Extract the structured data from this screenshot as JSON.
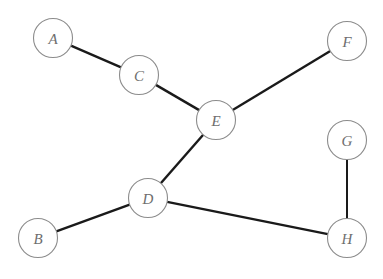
{
  "diagram": {
    "type": "node-link-graph",
    "background_color": "#ffffff",
    "node_fill": "#ffffff",
    "node_stroke": "#8c8c8c",
    "edge_color": "#1a1a1a",
    "label_color": "#6e6e6e",
    "node_radius": 19.5,
    "nodes": [
      {
        "id": "A",
        "label": "A",
        "cx": 53,
        "cy": 38
      },
      {
        "id": "B",
        "label": "B",
        "cx": 38,
        "cy": 238
      },
      {
        "id": "C",
        "label": "C",
        "cx": 139,
        "cy": 75
      },
      {
        "id": "D",
        "label": "D",
        "cx": 148,
        "cy": 198
      },
      {
        "id": "E",
        "label": "E",
        "cx": 216,
        "cy": 120
      },
      {
        "id": "F",
        "label": "F",
        "cx": 347,
        "cy": 41
      },
      {
        "id": "G",
        "label": "G",
        "cx": 347,
        "cy": 140
      },
      {
        "id": "H",
        "label": "H",
        "cx": 347,
        "cy": 238
      }
    ],
    "edges": [
      {
        "id": "A-C",
        "from": "A",
        "to": "C",
        "weight": "normal"
      },
      {
        "id": "C-E",
        "from": "C",
        "to": "E",
        "weight": "normal"
      },
      {
        "id": "E-F",
        "from": "E",
        "to": "F",
        "weight": "normal"
      },
      {
        "id": "E-D",
        "from": "E",
        "to": "D",
        "weight": "normal"
      },
      {
        "id": "D-B",
        "from": "D",
        "to": "B",
        "weight": "normal"
      },
      {
        "id": "D-H",
        "from": "D",
        "to": "H",
        "weight": "normal"
      },
      {
        "id": "G-H",
        "from": "G",
        "to": "H",
        "weight": "thin"
      }
    ]
  }
}
